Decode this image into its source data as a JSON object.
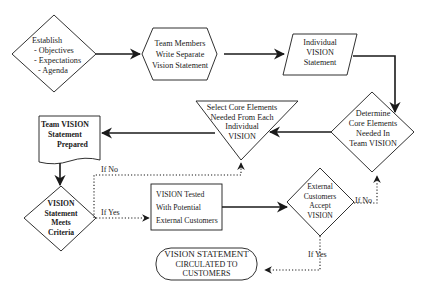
{
  "diagram": {
    "type": "flowchart",
    "nodes": {
      "establish": {
        "shape": "diamond",
        "lines": [
          "Establish",
          "- Objectives",
          "- Expectations",
          "- Agenda"
        ]
      },
      "team_members": {
        "shape": "hexagon",
        "lines": [
          "Team Members",
          "Write Separate",
          "Vision Statement"
        ]
      },
      "individual_vision": {
        "shape": "parallelogram",
        "lines": [
          "Individual",
          "VISION",
          "Statement"
        ]
      },
      "determine_core": {
        "shape": "diamond",
        "lines": [
          "Determine",
          "Core Elements",
          "Needed In",
          "Team VISION"
        ]
      },
      "select_core": {
        "shape": "inverted-triangle",
        "lines": [
          "Select Core Elements",
          "Needed From Each",
          "Individual",
          "VISION"
        ]
      },
      "team_statement": {
        "shape": "document",
        "lines": [
          "Team VISION",
          "Statement",
          "Prepared"
        ]
      },
      "meets_criteria": {
        "shape": "diamond",
        "lines": [
          "VISION",
          "Statement",
          "Meets",
          "Criteria"
        ]
      },
      "vision_tested": {
        "shape": "rectangle",
        "lines": [
          "VISION Tested",
          "With Potential",
          "External Customers"
        ]
      },
      "customers_accept": {
        "shape": "diamond",
        "lines": [
          "External",
          "Customers",
          "Accept",
          "VISION"
        ]
      },
      "circulated": {
        "shape": "rounded-terminal",
        "lines": [
          "VISION STATEMENT",
          "CIRCULATED TO",
          "CUSTOMERS"
        ]
      }
    },
    "conditions": {
      "criteria_no": "If No",
      "criteria_yes": "If Yes",
      "accept_no": "If No",
      "accept_yes": "If Yes"
    },
    "edges": [
      {
        "from": "establish",
        "to": "team_members",
        "style": "solid"
      },
      {
        "from": "team_members",
        "to": "individual_vision",
        "style": "solid"
      },
      {
        "from": "individual_vision",
        "to": "determine_core",
        "style": "solid"
      },
      {
        "from": "determine_core",
        "to": "select_core",
        "style": "solid"
      },
      {
        "from": "select_core",
        "to": "team_statement",
        "style": "solid"
      },
      {
        "from": "team_statement",
        "to": "meets_criteria",
        "style": "solid"
      },
      {
        "from": "meets_criteria",
        "to": "select_core",
        "label": "If No",
        "style": "dotted"
      },
      {
        "from": "meets_criteria",
        "to": "vision_tested",
        "label": "If Yes",
        "style": "dotted"
      },
      {
        "from": "vision_tested",
        "to": "customers_accept",
        "style": "solid"
      },
      {
        "from": "customers_accept",
        "to": "determine_core",
        "label": "If No",
        "style": "dotted"
      },
      {
        "from": "customers_accept",
        "to": "circulated",
        "label": "If Yes",
        "style": "dotted"
      }
    ],
    "colors": {
      "stroke": "#1a1a1a",
      "background": "#ffffff"
    }
  }
}
